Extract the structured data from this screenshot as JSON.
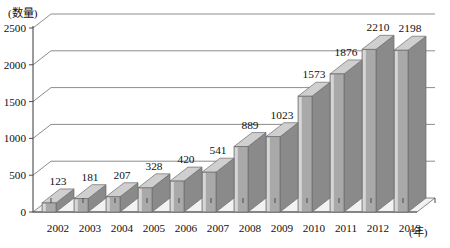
{
  "chart_data": {
    "type": "bar",
    "title": "",
    "subtitle": "",
    "xlabel": "(年)",
    "ylabel": "(数量)",
    "categories": [
      "2002",
      "2003",
      "2004",
      "2005",
      "2006",
      "2007",
      "2008",
      "2009",
      "2010",
      "2011",
      "2012",
      "2013"
    ],
    "values": [
      123,
      181,
      207,
      328,
      420,
      541,
      889,
      1023,
      1573,
      1876,
      2210,
      2198
    ],
    "value_labels": [
      "123",
      "181",
      "207",
      "328",
      "420",
      "541",
      "889",
      "1023",
      "1573",
      "1876",
      "2210",
      "2198"
    ],
    "ylim": [
      0,
      2500
    ],
    "ytick_labels": [
      "0",
      "500",
      "1000",
      "1500",
      "2000",
      "2500"
    ],
    "ytick_values": [
      0,
      500,
      1000,
      1500,
      2000,
      2500
    ],
    "grid": true,
    "legend": "none",
    "style": "3d-column",
    "colors": {
      "bar_front": "#a9a9a9",
      "bar_top": "#cfcfcf",
      "bar_side": "#8a8a8a",
      "grid": "#6e6e6e",
      "axis": "#4a4a4a",
      "text": "#111111",
      "background": "#ffffff",
      "floor": "#f2f2f2"
    }
  }
}
